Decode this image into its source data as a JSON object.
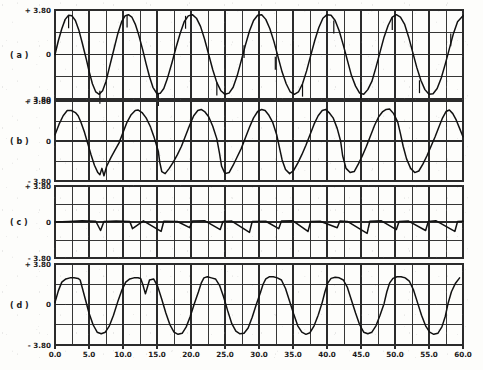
{
  "figure": {
    "kind": "multi-panel-oscillogram",
    "background_color": "#fdfdfb",
    "trace_color": "#111111",
    "grid_color": "#2b2b2b",
    "panel_count": 4
  },
  "axis": {
    "y_top_label": "+ 3.80",
    "y_mid_label": "0",
    "y_bottom_label": "- 3.80",
    "x_tick_labels": [
      "0.0",
      "5.0",
      "10.0",
      "15.0",
      "20.0",
      "25.0",
      "30.0",
      "35.0",
      "40.0",
      "45.0",
      "50.0",
      "55.0",
      "60.0"
    ]
  },
  "panels": [
    {
      "id": "a",
      "label": "( a )"
    },
    {
      "id": "b",
      "label": "( b )"
    },
    {
      "id": "c",
      "label": "( c )"
    },
    {
      "id": "d",
      "label": "( d )"
    }
  ],
  "chart_data": {
    "type": "line",
    "title": "",
    "xlabel": "",
    "ylabel": "",
    "xlim": [
      0.0,
      60.0
    ],
    "ylim": [
      -3.8,
      3.8
    ],
    "grid": true,
    "legend": "none",
    "x_major_ticks": [
      0.0,
      5.0,
      10.0,
      15.0,
      20.0,
      25.0,
      30.0,
      35.0,
      40.0,
      45.0,
      50.0,
      55.0,
      60.0
    ],
    "x_minor_step": 2.5,
    "y_ticks": [
      -3.8,
      -1.9,
      0,
      1.9,
      3.8
    ],
    "y_tick_labels": [
      "- 3.80",
      "",
      "0",
      "",
      "+ 3.80"
    ],
    "panels": [
      {
        "name": "( a )",
        "description": "smooth sinusoidal waveform, period approx 8.6, amplitude approx 3.4, with small narrow downward/upward commutation notches near peaks and zero crossings",
        "waveform": "sine",
        "period": 8.6,
        "amplitude": 3.4,
        "phase": 0.0,
        "offset": 0.0,
        "notches": [
          2.0,
          6.6,
          10.6,
          15.2,
          19.2,
          23.8,
          27.8,
          32.4,
          36.4,
          41.0,
          45.0,
          49.6,
          53.6,
          58.2
        ],
        "series": [
          {
            "name": "trace-a",
            "x": [
              0,
              0.5,
              1,
              1.5,
              2,
              2.5,
              3,
              3.5,
              4,
              4.3,
              4.6,
              5,
              5.5,
              6,
              6.5,
              7,
              7.5,
              8,
              8.6,
              9.2,
              9.8,
              10.3,
              10.8,
              11.3,
              11.8,
              12.3,
              12.9,
              13.4,
              13.9,
              14.4,
              15,
              15.5,
              16,
              16.5,
              17.2,
              17.8,
              18.4,
              19,
              19.6,
              20.2,
              20.8,
              21.4,
              22,
              22.6,
              23.2,
              23.8,
              24.4,
              25,
              25.6,
              26.2,
              26.8,
              27.4,
              28,
              28.6,
              29.2,
              29.8,
              30.4,
              31,
              31.6,
              32.2,
              32.8,
              33.4,
              34,
              34.6,
              35.2,
              35.8,
              36.4,
              37,
              37.6,
              38.2,
              38.8,
              39.4,
              40,
              40.6,
              41.2,
              41.8,
              42.4,
              43,
              43.6,
              44.2,
              44.8,
              45.4,
              46,
              46.6,
              47.2,
              47.8,
              48.4,
              49,
              49.6,
              50.2,
              50.8,
              51.4,
              52,
              52.6,
              53.2,
              53.8,
              54.4,
              55,
              55.6,
              56.2,
              56.8,
              57.4,
              58,
              58.6,
              59.2,
              60
            ],
            "y": [
              0,
              1.2,
              2.2,
              3.0,
              3.35,
              3.3,
              2.9,
              2.1,
              1.0,
              0.3,
              -0.4,
              -1.4,
              -2.5,
              -3.2,
              -3.4,
              -3.1,
              -2.3,
              -1.1,
              0.3,
              1.7,
              2.8,
              3.3,
              3.4,
              3.2,
              2.6,
              1.7,
              0.4,
              -0.8,
              -1.9,
              -2.8,
              -3.35,
              -3.3,
              -2.9,
              -2.1,
              -0.7,
              0.6,
              1.8,
              2.8,
              3.3,
              3.4,
              3.1,
              2.4,
              1.3,
              0.0,
              -1.3,
              -2.4,
              -3.1,
              -3.4,
              -3.3,
              -2.8,
              -1.8,
              -0.5,
              0.8,
              2.0,
              2.9,
              3.35,
              3.4,
              3.0,
              2.2,
              1.1,
              -0.2,
              -1.5,
              -2.5,
              -3.2,
              -3.4,
              -3.2,
              -2.5,
              -1.4,
              -0.1,
              1.2,
              2.3,
              3.1,
              3.4,
              3.35,
              2.9,
              2.0,
              0.8,
              -0.5,
              -1.8,
              -2.7,
              -3.3,
              -3.4,
              -3.0,
              -2.3,
              -1.1,
              0.2,
              1.5,
              2.5,
              3.2,
              3.4,
              3.2,
              2.6,
              1.5,
              0.2,
              -1.1,
              -2.2,
              -3.0,
              -3.4,
              -3.35,
              -2.9,
              -2.0,
              -0.8,
              0.5,
              1.8,
              2.8,
              3.3,
              0.2
            ]
          }
        ]
      },
      {
        "name": "( b )",
        "description": "distorted skewed quasi-sinusoid with flattened rounded crests, steep falling edges and sharp narrow negative spikes at troughs",
        "waveform": "distorted-sine",
        "period": 8.6,
        "amplitude": 3.2,
        "series": [
          {
            "name": "trace-b",
            "x": [
              0,
              0.6,
              1.2,
              1.8,
              2.4,
              3,
              3.4,
              3.8,
              4.3,
              4.8,
              5.3,
              5.8,
              6.3,
              6.6,
              6.9,
              7.2,
              7.6,
              8.2,
              8.8,
              9.4,
              10,
              10.6,
              11.2,
              11.8,
              12.2,
              12.8,
              13.4,
              14,
              14.6,
              15.2,
              15.4,
              15.7,
              16.2,
              16.8,
              17.4,
              18,
              18.6,
              19.2,
              19.8,
              20.4,
              21,
              21.5,
              22,
              22.6,
              23.2,
              23.8,
              24.2,
              24.5,
              25,
              25.6,
              26.2,
              26.8,
              27.4,
              28,
              28.6,
              29.2,
              29.8,
              30.4,
              30.9,
              31.4,
              32,
              32.6,
              33,
              33.4,
              33.9,
              34.5,
              35.1,
              35.7,
              36.3,
              36.9,
              37.5,
              38.1,
              38.7,
              39.3,
              39.8,
              40.3,
              40.9,
              41.5,
              42,
              42.3,
              42.8,
              43.4,
              44,
              44.6,
              45.2,
              45.8,
              46.4,
              47,
              47.6,
              48.2,
              48.7,
              49.2,
              49.8,
              50.4,
              50.8,
              51.2,
              51.7,
              52.3,
              52.9,
              53.5,
              54.1,
              54.7,
              55.3,
              55.9,
              56.5,
              57,
              57.5,
              58,
              58.5,
              59,
              59.5,
              60
            ],
            "y": [
              0.6,
              1.6,
              2.4,
              2.9,
              2.9,
              2.7,
              2.4,
              1.8,
              0.9,
              -0.2,
              -1.3,
              -2.3,
              -3.0,
              -3.2,
              -2.6,
              -3.3,
              -2.4,
              -1.6,
              -0.9,
              -0.2,
              0.8,
              1.8,
              2.5,
              2.9,
              2.95,
              2.7,
              2.2,
              1.4,
              0.3,
              -1.0,
              -2.0,
              -2.9,
              -3.1,
              -2.6,
              -2.0,
              -1.3,
              -0.5,
              0.5,
              1.5,
              2.4,
              2.9,
              3.0,
              2.8,
              2.3,
              1.4,
              0.2,
              -1.2,
              -2.4,
              -3.1,
              -3.0,
              -2.3,
              -1.5,
              -0.7,
              0.3,
              1.3,
              2.2,
              2.8,
              3.0,
              2.9,
              2.5,
              1.8,
              0.6,
              -0.6,
              -1.8,
              -2.7,
              -3.1,
              -2.8,
              -2.1,
              -1.3,
              -0.4,
              0.6,
              1.6,
              2.4,
              2.9,
              3.0,
              2.7,
              2.2,
              1.2,
              0.0,
              -1.4,
              -2.6,
              -3.0,
              -2.9,
              -2.2,
              -1.4,
              -0.5,
              0.5,
              1.5,
              2.3,
              2.8,
              3.0,
              3.05,
              2.6,
              1.8,
              0.7,
              -0.5,
              -1.7,
              -2.6,
              -3.0,
              -2.85,
              -2.2,
              -1.4,
              -0.5,
              0.4,
              1.4,
              2.2,
              2.8,
              2.95,
              2.6,
              2.0,
              1.2,
              0.4,
              0.9
            ]
          }
        ]
      },
      {
        "name": "( c )",
        "description": "near-zero residual/error trace with low-level ripple and sharp narrow downward spikes",
        "waveform": "near-zero-with-spikes",
        "baseline": 0.0,
        "ripple_amplitude": 0.15,
        "spike_times": [
          6.7,
          11.0,
          15.6,
          19.8,
          24.3,
          28.6,
          32.9,
          37.2,
          41.5,
          45.9,
          50.2,
          54.5,
          58.8
        ],
        "spike_depths": [
          -0.9,
          -0.7,
          -1.0,
          -0.6,
          -0.8,
          -1.1,
          -0.7,
          -1.0,
          -0.6,
          -1.2,
          -0.8,
          -0.9,
          -1.0
        ],
        "series": [
          {
            "name": "trace-c",
            "x": [
              0,
              2,
              4,
              6,
              6.7,
              7.2,
              9,
              11,
              11.4,
              13,
              15.6,
              16,
              18,
              19.8,
              20.2,
              22,
              24.3,
              24.7,
              26,
              28.6,
              29,
              31,
              32.9,
              33.3,
              35,
              37.2,
              37.6,
              39,
              41.5,
              41.9,
              43,
              45.9,
              46.3,
              48,
              50.2,
              50.6,
              52,
              54.5,
              54.9,
              56,
              58.8,
              59.2,
              60
            ],
            "y": [
              0,
              0.05,
              0.12,
              0.08,
              -0.9,
              0.05,
              0.1,
              0.06,
              -0.7,
              0.12,
              -1.0,
              0.08,
              0.05,
              -0.6,
              0.1,
              0.14,
              -0.8,
              0.06,
              0.1,
              -1.1,
              0.05,
              0.08,
              -0.7,
              0.1,
              0.12,
              -1.0,
              0.05,
              0.08,
              -0.6,
              0.1,
              0.06,
              -1.2,
              0.08,
              0.12,
              -0.8,
              0.06,
              0.1,
              -0.9,
              0.05,
              0.14,
              -1.0,
              0.06,
              0.08
            ]
          }
        ]
      },
      {
        "name": "( d )",
        "description": "flat-topped trapezoidal quasi-square waveform with rounded shoulders, steep edges and small notches at transitions",
        "waveform": "flat-topped-trapezoid",
        "period": 8.6,
        "amplitude": 2.6,
        "series": [
          {
            "name": "trace-d",
            "x": [
              0,
              0.5,
              1,
              1.6,
              2.2,
              2.8,
              3.4,
              3.7,
              4,
              4.5,
              5,
              5.6,
              6.2,
              6.8,
              7.4,
              8,
              8.6,
              9.2,
              9.8,
              10.4,
              11,
              11.6,
              12.2,
              12.6,
              12.9,
              13.3,
              13.9,
              14.5,
              15.1,
              15.7,
              16.3,
              16.9,
              17.5,
              18.1,
              18.7,
              19.3,
              19.9,
              20.5,
              21.1,
              21.5,
              21.9,
              22.4,
              23,
              23.6,
              24.2,
              24.8,
              25.4,
              26,
              26.6,
              27.2,
              27.8,
              28.4,
              29,
              29.6,
              30.2,
              30.6,
              31,
              31.5,
              32.1,
              32.7,
              33.3,
              33.9,
              34.5,
              35.1,
              35.7,
              36.3,
              36.9,
              37.5,
              38.1,
              38.7,
              39.3,
              39.7,
              40.1,
              40.6,
              41.2,
              41.8,
              42.4,
              43,
              43.6,
              44.2,
              44.8,
              45.4,
              46,
              46.6,
              47.2,
              47.8,
              48.4,
              48.8,
              49.2,
              49.7,
              50.3,
              50.9,
              51.5,
              52.1,
              52.7,
              53.3,
              53.9,
              54.5,
              55.1,
              55.7,
              56.3,
              56.9,
              57.4,
              57.8,
              58.3,
              58.9,
              59.5,
              60
            ],
            "y": [
              0.2,
              1.3,
              2.1,
              2.4,
              2.5,
              2.5,
              2.45,
              2.3,
              1.6,
              0.4,
              -0.8,
              -1.9,
              -2.6,
              -2.75,
              -2.6,
              -2.0,
              -1.0,
              0.2,
              1.3,
              2.1,
              2.4,
              2.5,
              2.5,
              2.45,
              1.9,
              1.0,
              2.3,
              2.4,
              1.7,
              0.5,
              -0.8,
              -1.9,
              -2.6,
              -2.8,
              -2.7,
              -2.1,
              -1.1,
              0.1,
              1.2,
              2.0,
              2.5,
              2.6,
              2.5,
              2.4,
              1.8,
              0.7,
              -0.6,
              -1.8,
              -2.5,
              -2.75,
              -2.7,
              -2.2,
              -1.2,
              0.0,
              1.1,
              1.9,
              2.4,
              2.6,
              2.6,
              2.5,
              2.3,
              1.5,
              0.3,
              -0.9,
              -2.0,
              -2.6,
              -2.8,
              -2.65,
              -2.0,
              -1.0,
              0.2,
              1.2,
              2.0,
              2.45,
              2.55,
              2.5,
              2.3,
              1.6,
              0.4,
              -0.8,
              -1.9,
              -2.6,
              -2.75,
              -2.6,
              -2.0,
              -1.0,
              0.1,
              1.2,
              2.0,
              2.45,
              2.6,
              2.6,
              2.5,
              2.2,
              1.4,
              0.2,
              -1.0,
              -2.0,
              -2.6,
              -2.8,
              -2.7,
              -2.1,
              -1.1,
              0.1,
              1.2,
              2.0,
              2.5
            ]
          }
        ]
      }
    ]
  }
}
